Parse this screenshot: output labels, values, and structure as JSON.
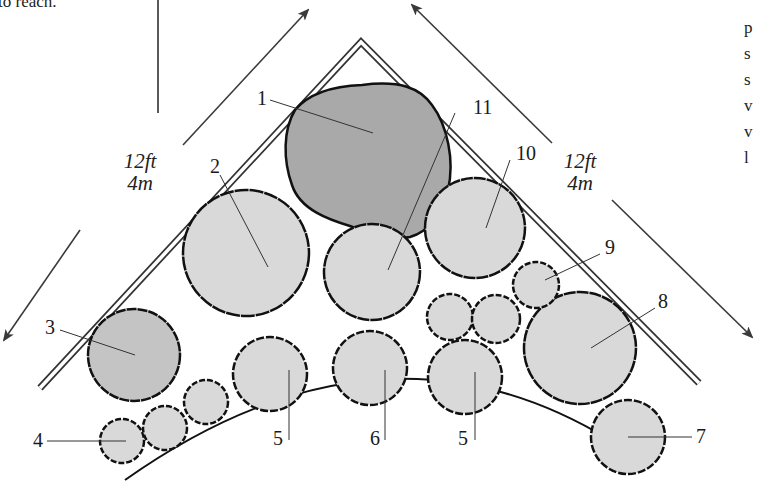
{
  "page": {
    "top_left_text_fragment": "to reach.",
    "right_edge_letters": [
      "p",
      "s",
      "s",
      "v",
      "v",
      "l"
    ]
  },
  "dimensions": {
    "left_side": {
      "ft": "12ft",
      "m": "4m"
    },
    "right_side": {
      "ft": "12ft",
      "m": "4m"
    }
  },
  "plants": [
    {
      "label": "1",
      "shade": "dark",
      "shape": "round"
    },
    {
      "label": "2",
      "shade": "light",
      "shape": "round"
    },
    {
      "label": "3",
      "shade": "mid",
      "shape": "round"
    },
    {
      "label": "4",
      "shade": "light",
      "shape": "shrub"
    },
    {
      "label": "5",
      "shade": "light",
      "shape": "shrub"
    },
    {
      "label": "6",
      "shade": "light",
      "shape": "shrub"
    },
    {
      "label": "5",
      "shade": "light",
      "shape": "shrub"
    },
    {
      "label": "7",
      "shade": "light",
      "shape": "shrub"
    },
    {
      "label": "8",
      "shade": "light",
      "shape": "round"
    },
    {
      "label": "9",
      "shade": "light",
      "shape": "shrub"
    },
    {
      "label": "10",
      "shade": "light",
      "shape": "round"
    },
    {
      "label": "11",
      "shade": "light",
      "shape": "round"
    }
  ],
  "colors": {
    "dark_fill": "#a9a9a9",
    "mid_fill": "#c4c4c4",
    "light_fill": "#d9d9d9",
    "outline": "#111111",
    "wall": "#333333",
    "arrow": "#3a3a3a"
  }
}
